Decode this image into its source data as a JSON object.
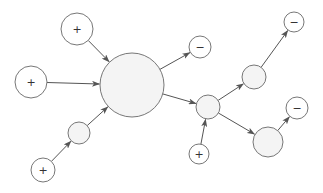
{
  "diagram": {
    "colors": {
      "stroke": "#777777",
      "fill": "#f4f4f4",
      "edge": "#555555",
      "background": "#ffffff"
    },
    "nodes": [
      {
        "id": "plus-top",
        "cx": 77,
        "cy": 29,
        "r": 16,
        "label": "+"
      },
      {
        "id": "plus-left",
        "cx": 31,
        "cy": 82,
        "r": 16,
        "label": "+"
      },
      {
        "id": "hub",
        "cx": 132,
        "cy": 85,
        "r": 32,
        "label": ""
      },
      {
        "id": "small-lower-left",
        "cx": 79,
        "cy": 133,
        "r": 11,
        "label": ""
      },
      {
        "id": "plus-bottom-left",
        "cx": 43,
        "cy": 170,
        "r": 12,
        "label": "+"
      },
      {
        "id": "minus-top-mid",
        "cx": 200,
        "cy": 47,
        "r": 11,
        "label": "−"
      },
      {
        "id": "mid",
        "cx": 208,
        "cy": 107,
        "r": 12,
        "label": ""
      },
      {
        "id": "plus-bottom",
        "cx": 199,
        "cy": 154,
        "r": 10,
        "label": "+"
      },
      {
        "id": "upper-right",
        "cx": 254,
        "cy": 77,
        "r": 12,
        "label": ""
      },
      {
        "id": "minus-top-right",
        "cx": 294,
        "cy": 22,
        "r": 10,
        "label": "−"
      },
      {
        "id": "lower-right",
        "cx": 268,
        "cy": 142,
        "r": 15,
        "label": ""
      },
      {
        "id": "minus-right",
        "cx": 297,
        "cy": 108,
        "r": 11,
        "label": "−"
      }
    ],
    "edges": [
      {
        "from": "plus-top",
        "to": "hub"
      },
      {
        "from": "plus-left",
        "to": "hub"
      },
      {
        "from": "plus-bottom-left",
        "to": "small-lower-left"
      },
      {
        "from": "small-lower-left",
        "to": "hub"
      },
      {
        "from": "hub",
        "to": "minus-top-mid"
      },
      {
        "from": "hub",
        "to": "mid"
      },
      {
        "from": "plus-bottom",
        "to": "mid"
      },
      {
        "from": "mid",
        "to": "upper-right"
      },
      {
        "from": "upper-right",
        "to": "minus-top-right"
      },
      {
        "from": "mid",
        "to": "lower-right"
      },
      {
        "from": "lower-right",
        "to": "minus-right"
      }
    ]
  }
}
